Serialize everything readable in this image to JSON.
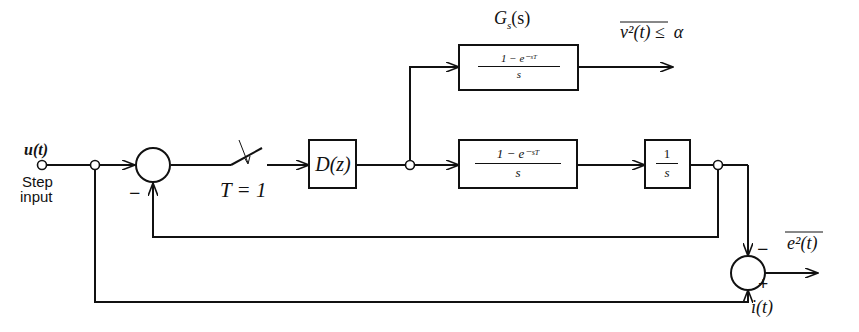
{
  "input": {
    "signal": "u(t)",
    "caption_line1": "Step",
    "caption_line2": "input"
  },
  "sampler": {
    "label": "T = 1"
  },
  "controller": {
    "label": "D(z)"
  },
  "top_block": {
    "name_label": "Gs(s)",
    "name_main": "G",
    "name_sub": "s",
    "name_arg": "(s)",
    "numerator": "1 − e⁻ˢᵀ",
    "denominator": "s"
  },
  "top_output": {
    "constraint_overbar": "v²(t)",
    "relation": "≤",
    "bound": "α"
  },
  "plant_hold": {
    "numerator": "1 − e⁻ˢᵀ",
    "denominator": "s"
  },
  "plant_integrator": {
    "numerator": "1",
    "denominator": "s"
  },
  "summer1": {
    "feedback_sign": "−"
  },
  "summer2": {
    "top_sign": "−",
    "bottom_sign": "+",
    "ideal_signal": "i(t)",
    "output_overbar": "e²(t)"
  }
}
